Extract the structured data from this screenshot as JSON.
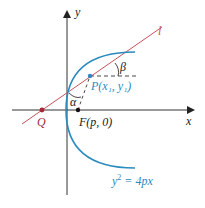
{
  "diagram": {
    "colors": {
      "curve": "#2b8bbf",
      "tangent": "#c9525a",
      "point_q": "#a3293a",
      "axis": "#222222",
      "dashed": "#333333"
    },
    "labels": {
      "y_axis": "y",
      "x_axis": "x",
      "tangent_line": "l",
      "angle_beta": "β",
      "angle_alpha": "α",
      "point_p": "P(x₁, y₁)",
      "point_q": "Q",
      "focus": "F(p, 0)",
      "equation_lhs": "y",
      "equation_exp": "2",
      "equation_rhs": " = 4px"
    }
  }
}
